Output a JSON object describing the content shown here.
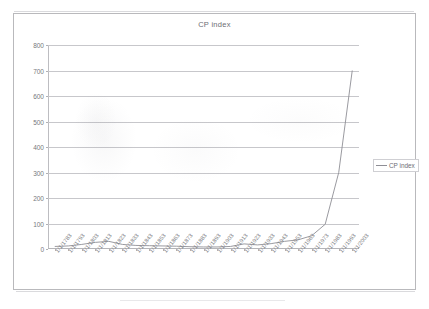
{
  "chart_data": {
    "type": "line",
    "title": "CP index",
    "xlabel": "",
    "ylabel": "",
    "ylim": [
      0,
      800
    ],
    "ytick_labels": [
      "800",
      "700",
      "600",
      "500",
      "400",
      "300",
      "200",
      "100",
      "0"
    ],
    "ytick_values": [
      800,
      700,
      600,
      500,
      400,
      300,
      200,
      100,
      0
    ],
    "grid": true,
    "legend_position": "right",
    "legend_entries": [
      "CP index"
    ],
    "categories": [
      "1/1/1783",
      "1/1/1793",
      "1/1/1803",
      "1/1/1813",
      "1/1/1823",
      "1/1/1833",
      "1/1/1843",
      "1/1/1853",
      "1/1/1863",
      "1/1/1873",
      "1/1/1883",
      "1/1/1893",
      "1/1/1903",
      "1/1/1913",
      "1/1/1923",
      "1/1/1933",
      "1/1/1943",
      "1/1/1953",
      "1/1/1963",
      "1/1/1973",
      "1/1/1983",
      "1/1/1993",
      "1/1/2003"
    ],
    "series": [
      {
        "name": "CP index",
        "values": [
          9,
          10,
          13,
          20,
          24,
          14,
          11,
          11,
          13,
          10,
          9,
          8,
          8,
          10,
          18,
          14,
          18,
          27,
          31,
          43,
          100,
          145,
          184
        ]
      }
    ],
    "annotations": [
      "Line is a faint grayscale single series (scanned document)",
      "Curve is nearly flat from 1783 to about 1963 then rises steeply",
      "Final value reaches approximately 700 at 1/1/2003"
    ],
    "plot_points": [
      {
        "x": "1/1/1783",
        "y": 10
      },
      {
        "x": "1/1/1793",
        "y": 12
      },
      {
        "x": "1/1/1803",
        "y": 18
      },
      {
        "x": "1/1/1813",
        "y": 26
      },
      {
        "x": "1/1/1823",
        "y": 30
      },
      {
        "x": "1/1/1833",
        "y": 18
      },
      {
        "x": "1/1/1843",
        "y": 14
      },
      {
        "x": "1/1/1853",
        "y": 13
      },
      {
        "x": "1/1/1863",
        "y": 12
      },
      {
        "x": "1/1/1873",
        "y": 11
      },
      {
        "x": "1/1/1883",
        "y": 9
      },
      {
        "x": "1/1/1893",
        "y": 8
      },
      {
        "x": "1/1/1903",
        "y": 8
      },
      {
        "x": "1/1/1913",
        "y": 10
      },
      {
        "x": "1/1/1923",
        "y": 20
      },
      {
        "x": "1/1/1933",
        "y": 16
      },
      {
        "x": "1/1/1943",
        "y": 21
      },
      {
        "x": "1/1/1953",
        "y": 30
      },
      {
        "x": "1/1/1963",
        "y": 36
      },
      {
        "x": "1/1/1973",
        "y": 52
      },
      {
        "x": "1/1/1983",
        "y": 97
      },
      {
        "x": "1/1/1993",
        "y": 300
      },
      {
        "x": "1/1/2003",
        "y": 700
      }
    ],
    "colors": {
      "series_line": "#8e8e95",
      "gridline": "#c7c7cb",
      "axis": "#b5b5b9",
      "text": "#75757b",
      "frame": "#b9b9bc",
      "background": "#ffffff"
    }
  }
}
